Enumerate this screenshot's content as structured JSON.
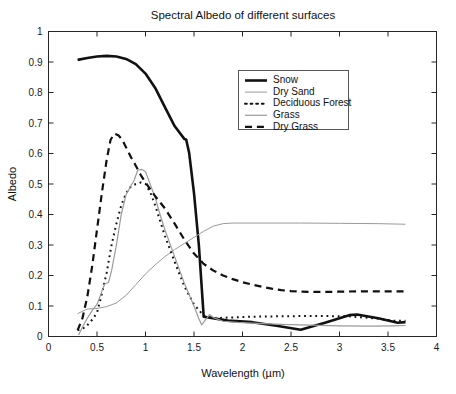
{
  "chart_data": {
    "type": "line",
    "title": "Spectral Albedo of different surfaces",
    "xlabel": "Wavelength (µm)",
    "ylabel": "Albedo",
    "xlim": [
      0,
      4
    ],
    "ylim": [
      0,
      1
    ],
    "grid": false,
    "legend_position": "upper-center-right",
    "xticks": [
      "0",
      "0.5",
      "1",
      "1.5",
      "2",
      "2.5",
      "3",
      "3.5",
      "4"
    ],
    "xtick_values": [
      0,
      0.5,
      1,
      1.5,
      2,
      2.5,
      3,
      3.5,
      4
    ],
    "yticks": [
      "0",
      "0.1",
      "0.2",
      "0.3",
      "0.4",
      "0.5",
      "0.6",
      "0.7",
      "0.8",
      "0.9",
      "1"
    ],
    "ytick_values": [
      0,
      0.1,
      0.2,
      0.3,
      0.4,
      0.5,
      0.6,
      0.7,
      0.8,
      0.9,
      1
    ],
    "series": [
      {
        "name": "Snow",
        "color": "#111111",
        "width": 2.6,
        "dash": "none",
        "points": [
          [
            0.3,
            0.907
          ],
          [
            0.4,
            0.913
          ],
          [
            0.5,
            0.918
          ],
          [
            0.6,
            0.92
          ],
          [
            0.7,
            0.918
          ],
          [
            0.8,
            0.91
          ],
          [
            0.9,
            0.893
          ],
          [
            1.0,
            0.862
          ],
          [
            1.1,
            0.815
          ],
          [
            1.2,
            0.752
          ],
          [
            1.3,
            0.69
          ],
          [
            1.4,
            0.648
          ],
          [
            1.42,
            0.645
          ],
          [
            1.45,
            0.602
          ],
          [
            1.5,
            0.47
          ],
          [
            1.55,
            0.3
          ],
          [
            1.6,
            0.065
          ],
          [
            1.85,
            0.052
          ],
          [
            2.1,
            0.047
          ],
          [
            2.35,
            0.035
          ],
          [
            2.6,
            0.022
          ],
          [
            2.85,
            0.045
          ],
          [
            3.1,
            0.07
          ],
          [
            3.18,
            0.072
          ],
          [
            3.4,
            0.06
          ],
          [
            3.6,
            0.045
          ],
          [
            3.68,
            0.047
          ]
        ]
      },
      {
        "name": "Dry Sand",
        "color": "#9a9a9a",
        "width": 1.0,
        "dash": "none",
        "points": [
          [
            0.3,
            0.075
          ],
          [
            0.4,
            0.09
          ],
          [
            0.5,
            0.092
          ],
          [
            0.6,
            0.098
          ],
          [
            0.7,
            0.11
          ],
          [
            0.8,
            0.135
          ],
          [
            0.9,
            0.17
          ],
          [
            1.0,
            0.205
          ],
          [
            1.1,
            0.235
          ],
          [
            1.2,
            0.262
          ],
          [
            1.3,
            0.285
          ],
          [
            1.4,
            0.305
          ],
          [
            1.5,
            0.325
          ],
          [
            1.6,
            0.345
          ],
          [
            1.7,
            0.362
          ],
          [
            1.8,
            0.37
          ],
          [
            1.9,
            0.372
          ],
          [
            2.2,
            0.372
          ],
          [
            2.6,
            0.372
          ],
          [
            3.0,
            0.371
          ],
          [
            3.4,
            0.37
          ],
          [
            3.68,
            0.368
          ]
        ]
      },
      {
        "name": "Deciduous Forest",
        "color": "#111111",
        "width": 2.0,
        "dash": "dotted",
        "points": [
          [
            0.3,
            0.02
          ],
          [
            0.38,
            0.03
          ],
          [
            0.45,
            0.055
          ],
          [
            0.5,
            0.078
          ],
          [
            0.55,
            0.14
          ],
          [
            0.6,
            0.21
          ],
          [
            0.65,
            0.3
          ],
          [
            0.7,
            0.37
          ],
          [
            0.75,
            0.43
          ],
          [
            0.8,
            0.47
          ],
          [
            0.85,
            0.492
          ],
          [
            0.9,
            0.5
          ],
          [
            0.95,
            0.505
          ],
          [
            1.0,
            0.5
          ],
          [
            1.05,
            0.472
          ],
          [
            1.1,
            0.43
          ],
          [
            1.15,
            0.38
          ],
          [
            1.2,
            0.33
          ],
          [
            1.3,
            0.245
          ],
          [
            1.4,
            0.165
          ],
          [
            1.5,
            0.105
          ],
          [
            1.6,
            0.068
          ],
          [
            1.7,
            0.06
          ],
          [
            1.85,
            0.062
          ],
          [
            2.1,
            0.065
          ],
          [
            2.35,
            0.066
          ],
          [
            2.6,
            0.067
          ],
          [
            2.85,
            0.067
          ],
          [
            3.1,
            0.066
          ],
          [
            3.35,
            0.06
          ],
          [
            3.55,
            0.052
          ],
          [
            3.68,
            0.052
          ]
        ]
      },
      {
        "name": "Grass",
        "color": "#9a9a9a",
        "width": 1.2,
        "dash": "none",
        "points": [
          [
            0.31,
            0.005
          ],
          [
            0.35,
            0.03
          ],
          [
            0.4,
            0.06
          ],
          [
            0.45,
            0.085
          ],
          [
            0.5,
            0.105
          ],
          [
            0.55,
            0.148
          ],
          [
            0.58,
            0.172
          ],
          [
            0.62,
            0.178
          ],
          [
            0.65,
            0.215
          ],
          [
            0.7,
            0.3
          ],
          [
            0.75,
            0.4
          ],
          [
            0.8,
            0.465
          ],
          [
            0.85,
            0.495
          ],
          [
            0.88,
            0.51
          ],
          [
            0.92,
            0.545
          ],
          [
            0.96,
            0.548
          ],
          [
            1.0,
            0.54
          ],
          [
            1.05,
            0.498
          ],
          [
            1.1,
            0.455
          ],
          [
            1.15,
            0.4
          ],
          [
            1.2,
            0.35
          ],
          [
            1.3,
            0.262
          ],
          [
            1.4,
            0.175
          ],
          [
            1.5,
            0.1
          ],
          [
            1.55,
            0.058
          ],
          [
            1.58,
            0.038
          ],
          [
            1.62,
            0.055
          ],
          [
            1.66,
            0.072
          ],
          [
            1.7,
            0.062
          ],
          [
            1.8,
            0.05
          ],
          [
            1.95,
            0.046
          ],
          [
            2.15,
            0.043
          ],
          [
            2.4,
            0.04
          ],
          [
            2.7,
            0.037
          ],
          [
            3.0,
            0.035
          ],
          [
            3.3,
            0.034
          ],
          [
            3.55,
            0.035
          ],
          [
            3.68,
            0.036
          ]
        ]
      },
      {
        "name": "Dry Grass",
        "color": "#111111",
        "width": 2.2,
        "dash": "dashed",
        "points": [
          [
            0.3,
            0.02
          ],
          [
            0.35,
            0.06
          ],
          [
            0.4,
            0.13
          ],
          [
            0.45,
            0.23
          ],
          [
            0.5,
            0.35
          ],
          [
            0.55,
            0.47
          ],
          [
            0.6,
            0.58
          ],
          [
            0.64,
            0.645
          ],
          [
            0.68,
            0.665
          ],
          [
            0.72,
            0.66
          ],
          [
            0.76,
            0.645
          ],
          [
            0.8,
            0.62
          ],
          [
            0.85,
            0.588
          ],
          [
            0.9,
            0.56
          ],
          [
            0.95,
            0.53
          ],
          [
            1.0,
            0.505
          ],
          [
            1.05,
            0.482
          ],
          [
            1.1,
            0.46
          ],
          [
            1.2,
            0.42
          ],
          [
            1.3,
            0.37
          ],
          [
            1.4,
            0.318
          ],
          [
            1.5,
            0.272
          ],
          [
            1.6,
            0.238
          ],
          [
            1.7,
            0.216
          ],
          [
            1.8,
            0.2
          ],
          [
            1.9,
            0.188
          ],
          [
            2.0,
            0.178
          ],
          [
            2.1,
            0.17
          ],
          [
            2.2,
            0.163
          ],
          [
            2.3,
            0.157
          ],
          [
            2.4,
            0.152
          ],
          [
            2.5,
            0.149
          ],
          [
            2.6,
            0.147
          ],
          [
            2.8,
            0.146
          ],
          [
            3.0,
            0.147
          ],
          [
            3.2,
            0.148
          ],
          [
            3.4,
            0.148
          ],
          [
            3.6,
            0.148
          ],
          [
            3.68,
            0.148
          ]
        ]
      }
    ]
  },
  "legend": {
    "entries": [
      {
        "label": "Snow"
      },
      {
        "label": "Dry Sand"
      },
      {
        "label": "Deciduous Forest"
      },
      {
        "label": "Grass"
      },
      {
        "label": "Dry Grass"
      }
    ]
  }
}
